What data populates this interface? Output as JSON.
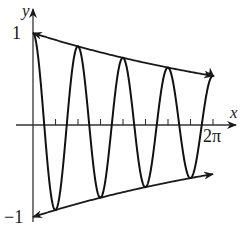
{
  "chart_data": {
    "type": "line",
    "title": "",
    "function": "y = e^(-0.1x) cos(4x)",
    "xlabel": "x",
    "ylabel": "y",
    "xlim": [
      0,
      6.2832
    ],
    "ylim": [
      -1,
      1
    ],
    "x_tick_labels": [
      "2π"
    ],
    "y_tick_labels": [
      "1",
      "−1"
    ],
    "x_ticks": [
      "π/4",
      "π/2",
      "3π/4",
      "π",
      "5π/4",
      "3π/2",
      "7π/4",
      "2π"
    ],
    "grid": false,
    "series": [
      {
        "name": "damped cosine",
        "formula": "e^(-0.1x)cos(4x)",
        "style": "solid"
      },
      {
        "name": "upper envelope",
        "formula": "e^(-0.1x)",
        "style": "solid-arrow"
      },
      {
        "name": "lower envelope",
        "formula": "-e^(-0.1x)",
        "style": "solid-arrow"
      }
    ],
    "peaks": [
      {
        "x": 0,
        "y": 1.0
      },
      {
        "x": 1.571,
        "y": 0.855
      },
      {
        "x": 3.142,
        "y": 0.73
      },
      {
        "x": 4.712,
        "y": 0.624
      }
    ],
    "troughs": [
      {
        "x": 0.785,
        "y": -0.925
      },
      {
        "x": 2.356,
        "y": -0.79
      },
      {
        "x": 3.927,
        "y": -0.675
      },
      {
        "x": 5.498,
        "y": -0.577
      }
    ]
  },
  "labels": {
    "x_axis": "x",
    "y_axis": "y",
    "y_top": "1",
    "y_bottom": "−1",
    "x_end": "2π"
  }
}
